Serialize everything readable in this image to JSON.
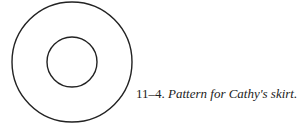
{
  "figure": {
    "outer_circle": {
      "cx": 72,
      "cy": 62,
      "r": 60,
      "stroke": "#222222"
    },
    "inner_circle": {
      "cx": 72,
      "cy": 62,
      "r": 25,
      "stroke": "#222222"
    }
  },
  "caption": {
    "number": "11–4.",
    "text": "Pattern for Cathy's skirt."
  }
}
